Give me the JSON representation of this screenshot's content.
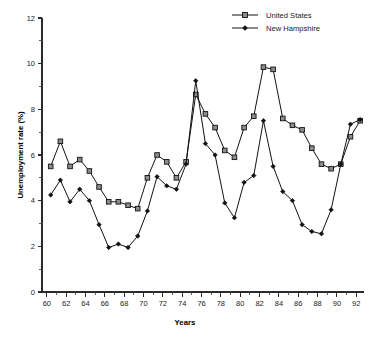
{
  "chart_data": {
    "type": "line",
    "title": "",
    "xlabel": "Years",
    "ylabel": "Unemployment rate (%)",
    "xlim": [
      59.5,
      92.8
    ],
    "ylim": [
      0,
      12
    ],
    "grid": false,
    "legend_position": "top-right",
    "x_tick_labels": [
      "60",
      "62",
      "64",
      "66",
      "68",
      "70",
      "72",
      "74",
      "76",
      "78",
      "80",
      "82",
      "84",
      "86",
      "88",
      "90",
      "92"
    ],
    "x_tick_values": [
      60,
      62,
      64,
      66,
      68,
      70,
      72,
      74,
      76,
      78,
      80,
      82,
      84,
      86,
      88,
      90,
      92
    ],
    "x_minor_tick_values": [
      61,
      63,
      65,
      67,
      69,
      71,
      73,
      75,
      77,
      79,
      81,
      83,
      85,
      87,
      89,
      91
    ],
    "y_tick_labels": [
      "0",
      "2",
      "4",
      "6",
      "8",
      "10",
      "12"
    ],
    "y_tick_values": [
      0,
      2,
      4,
      6,
      8,
      10,
      12
    ],
    "y_minor_tick_values": [
      1,
      3,
      5,
      7,
      9,
      11
    ],
    "x": [
      60.4,
      61.4,
      62.4,
      63.4,
      64.4,
      65.4,
      66.4,
      67.4,
      68.4,
      69.4,
      70.4,
      71.4,
      72.4,
      73.4,
      74.4,
      75.4,
      76.4,
      77.4,
      78.4,
      79.4,
      80.4,
      81.4,
      82.4,
      83.4,
      84.4,
      85.4,
      86.4,
      87.4,
      88.4,
      89.4,
      90.4,
      91.4,
      92.4
    ],
    "series": [
      {
        "name": "United States",
        "marker": "open-square",
        "values": [
          5.5,
          6.6,
          5.5,
          5.8,
          5.3,
          4.6,
          3.95,
          3.95,
          3.8,
          3.65,
          5.0,
          6.0,
          5.7,
          5.0,
          5.7,
          8.65,
          7.8,
          7.2,
          6.2,
          5.9,
          7.2,
          7.7,
          9.85,
          9.75,
          7.6,
          7.3,
          7.1,
          6.3,
          5.6,
          5.4,
          5.6,
          6.8,
          7.5
        ]
      },
      {
        "name": "New Hampshire",
        "marker": "filled-diamond",
        "values": [
          4.25,
          4.9,
          3.95,
          4.5,
          4.0,
          2.95,
          1.95,
          2.1,
          1.95,
          2.45,
          3.55,
          5.05,
          4.65,
          4.5,
          5.6,
          9.25,
          6.5,
          6.0,
          3.9,
          3.25,
          4.8,
          5.1,
          7.5,
          5.5,
          4.4,
          4.0,
          2.95,
          2.65,
          2.55,
          3.6,
          5.6,
          7.35,
          7.55
        ]
      }
    ]
  },
  "legend": {
    "entries": [
      {
        "label": "United States"
      },
      {
        "label": "New Hampshire"
      }
    ]
  },
  "caption": {
    "fragment_left": "",
    "fragment_right": ""
  }
}
